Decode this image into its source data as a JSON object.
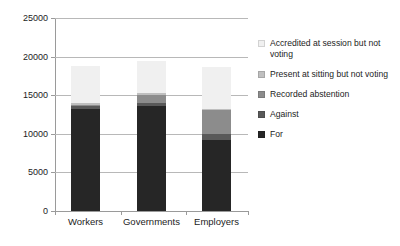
{
  "chart_data": {
    "type": "bar",
    "subtype": "stacked-bar",
    "title": "",
    "xlabel": "",
    "ylabel": "",
    "categories": [
      "Workers",
      "Governments",
      "Employers"
    ],
    "ylim": [
      0,
      25000
    ],
    "ytick_labels": [
      "0",
      "5000",
      "10000",
      "15000",
      "20000",
      "25000"
    ],
    "ytick_values": [
      0,
      5000,
      10000,
      15000,
      20000,
      25000
    ],
    "grid": true,
    "legend_position": "right",
    "series": [
      {
        "name": "For",
        "color": "#262626",
        "values": [
          13200,
          13550,
          9200
        ]
      },
      {
        "name": "Against",
        "color": "#595959",
        "values": [
          350,
          400,
          800
        ]
      },
      {
        "name": "Recorded abstention",
        "color": "#8c8c8c",
        "values": [
          250,
          1050,
          3050
        ]
      },
      {
        "name": "Present at sitting but not voting",
        "color": "#bfbfbf",
        "values": [
          150,
          300,
          200
        ]
      },
      {
        "name": "Accredited at session but not voting",
        "color": "#f0f0f0",
        "values": [
          4850,
          4100,
          5350
        ]
      }
    ]
  },
  "legend": {
    "items": [
      {
        "label": "Accredited at session but not voting",
        "color": "#f0f0f0"
      },
      {
        "label": "Present at sitting but not voting",
        "color": "#bfbfbf"
      },
      {
        "label": "Recorded abstention",
        "color": "#8c8c8c"
      },
      {
        "label": "Against",
        "color": "#595959"
      },
      {
        "label": "For",
        "color": "#262626"
      }
    ]
  },
  "axis": {
    "y_labels": [
      "25000",
      "20000",
      "15000",
      "10000",
      "5000",
      "0"
    ],
    "x_labels": [
      "Workers",
      "Governments",
      "Employers"
    ]
  }
}
